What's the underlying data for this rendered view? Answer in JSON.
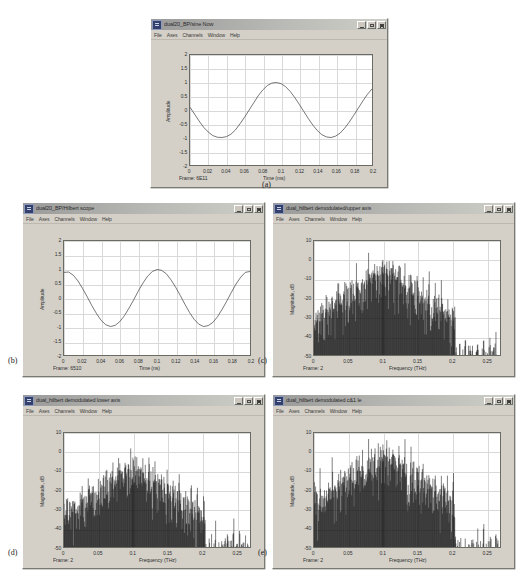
{
  "figure": {
    "background": "#ffffff",
    "captions": [
      {
        "id": "a",
        "label": "(a)"
      },
      {
        "id": "b",
        "label": "(b)"
      },
      {
        "id": "c",
        "label": "(c)"
      },
      {
        "id": "d",
        "label": "(d)"
      },
      {
        "id": "e",
        "label": "(e)"
      }
    ]
  },
  "common": {
    "menu": [
      "File",
      "Axes",
      "Channels",
      "Window",
      "Help"
    ],
    "window_buttons": [
      "minimize",
      "maximize",
      "close"
    ],
    "title_icon": "scope-icon"
  },
  "panels": {
    "a": {
      "title": "dual20_BP/sine Now",
      "frame_status": "Frame: 6E11",
      "chart_data": {
        "type": "line",
        "title": "dual20_BP/sine Now",
        "xlabel": "Time (ms)",
        "ylabel": "Amplitude",
        "xlim": [
          0,
          0.2
        ],
        "ylim": [
          -2,
          2
        ],
        "xticks": [
          "0",
          "0.02",
          "0.04",
          "0.06",
          "0.08",
          "0.1",
          "0.12",
          "0.14",
          "0.16",
          "0.18",
          "0.2"
        ],
        "yticks": [
          "2",
          "1.5",
          "1",
          "0.5",
          "0",
          "-0.5",
          "-1",
          "-1.5",
          "-2"
        ],
        "grid": true,
        "legend": "none",
        "series": [
          {
            "name": "sine",
            "description": "sinusoid, amplitude 1, period 0.12 ms, starting near 0 and descending",
            "x": [
              0,
              0.005,
              0.01,
              0.015,
              0.02,
              0.025,
              0.03,
              0.035,
              0.04,
              0.045,
              0.05,
              0.055,
              0.06,
              0.065,
              0.07,
              0.075,
              0.08,
              0.085,
              0.09,
              0.095,
              0.1,
              0.105,
              0.11,
              0.115,
              0.12,
              0.125,
              0.13,
              0.135,
              0.14,
              0.145,
              0.15,
              0.155,
              0.16,
              0.165,
              0.17,
              0.175,
              0.18,
              0.185,
              0.19,
              0.195,
              0.2
            ],
            "y": [
              0.1,
              -0.15,
              -0.4,
              -0.63,
              -0.8,
              -0.93,
              -0.99,
              -1.0,
              -0.97,
              -0.88,
              -0.72,
              -0.5,
              -0.26,
              0.0,
              0.26,
              0.52,
              0.73,
              0.89,
              0.98,
              1.0,
              0.96,
              0.85,
              0.68,
              0.46,
              0.21,
              -0.05,
              -0.31,
              -0.55,
              -0.75,
              -0.9,
              -0.98,
              -1.0,
              -0.95,
              -0.84,
              -0.66,
              -0.44,
              -0.19,
              0.07,
              0.33,
              0.57,
              0.77
            ]
          }
        ]
      }
    },
    "b": {
      "title": "dual20_BP/Hilbert scope",
      "frame_status": "Frame: 6510",
      "chart_data": {
        "type": "line",
        "title": "dual20_BP/Hilbert scope",
        "xlabel": "Time (ns)",
        "ylabel": "Amplitude",
        "xlim": [
          0,
          0.2
        ],
        "ylim": [
          -2,
          2
        ],
        "xticks": [
          "0",
          "0.02",
          "0.04",
          "0.06",
          "0.08",
          "0.1",
          "0.12",
          "0.14",
          "0.16",
          "0.18",
          "0.2"
        ],
        "yticks": [
          "2",
          "1.5",
          "1",
          "0.5",
          "0",
          "-0.5",
          "-1",
          "-1.5",
          "-2"
        ],
        "grid": true,
        "legend": "none",
        "series": [
          {
            "name": "hilbert",
            "description": "cosine-like wave, amplitude 1, period 0.12 ns, starting at about +0.9",
            "x": [
              0,
              0.005,
              0.01,
              0.015,
              0.02,
              0.025,
              0.03,
              0.035,
              0.04,
              0.045,
              0.05,
              0.055,
              0.06,
              0.065,
              0.07,
              0.075,
              0.08,
              0.085,
              0.09,
              0.095,
              0.1,
              0.105,
              0.11,
              0.115,
              0.12,
              0.125,
              0.13,
              0.135,
              0.14,
              0.145,
              0.15,
              0.155,
              0.16,
              0.165,
              0.17,
              0.175,
              0.18,
              0.185,
              0.19,
              0.195,
              0.2
            ],
            "y": [
              0.9,
              0.91,
              0.8,
              0.6,
              0.33,
              0.04,
              -0.27,
              -0.55,
              -0.79,
              -0.94,
              -1.0,
              -0.96,
              -0.83,
              -0.62,
              -0.35,
              -0.06,
              0.25,
              0.53,
              0.77,
              0.93,
              1.0,
              0.97,
              0.85,
              0.64,
              0.38,
              0.09,
              -0.22,
              -0.51,
              -0.75,
              -0.92,
              -1.0,
              -0.97,
              -0.86,
              -0.66,
              -0.4,
              -0.11,
              0.2,
              0.49,
              0.73,
              0.9,
              0.93
            ]
          }
        ]
      }
    },
    "c": {
      "title": "dual_hilbert demodulated/upper axis",
      "frame_status": "Frame: 2",
      "chart_data": {
        "type": "line",
        "title": "dual_hilbert demodulated/upper axis",
        "xlabel": "Frequency (THz)",
        "ylabel": "Magnitude, dB",
        "xlim": [
          0,
          0.27
        ],
        "ylim": [
          -50,
          10
        ],
        "xticks": [
          "0",
          "0.05",
          "0.1",
          "0.15",
          "0.2",
          "0.25"
        ],
        "yticks": [
          "10",
          "0",
          "-10",
          "-20",
          "-30",
          "-40",
          "-50"
        ],
        "grid": true,
        "legend": "none",
        "peak_frequency": 0.1,
        "peak_magnitude": 0,
        "noise_floor": -50,
        "description": "dense line spectrum with main lobe peaking near 0 dB at 0.1 THz, dropping to about -50 dB noise floor, sidelobe comb across 0 to 0.2 THz"
      }
    },
    "d": {
      "title": "dual_hilbert demodulated lower axis",
      "frame_status": "Frame: 2",
      "chart_data": {
        "type": "line",
        "title": "dual_hilbert demodulated lower axis",
        "xlabel": "Frequency (THz)",
        "ylabel": "Magnitude, dB",
        "xlim": [
          0,
          0.27
        ],
        "ylim": [
          -50,
          10
        ],
        "xticks": [
          "0",
          "0.05",
          "0.1",
          "0.15",
          "0.2",
          "0.25"
        ],
        "yticks": [
          "10",
          "0",
          "-10",
          "-20",
          "-30",
          "-40",
          "-50"
        ],
        "grid": true,
        "legend": "none",
        "peak_frequency": 0.1,
        "peak_magnitude": -3,
        "noise_floor": -50,
        "description": "dense line spectrum, main peak near -3 dB at 0.1 THz, strong sidebands and comb of discrete lines down to -50 dB"
      }
    },
    "e": {
      "title": "dual_hilbert demodulated c&1 le",
      "frame_status": "Frame: 2",
      "chart_data": {
        "type": "line",
        "title": "dual_hilbert demodulated c&1 le",
        "xlabel": "Frequency (THz)",
        "ylabel": "Magnitude, dB",
        "xlim": [
          0,
          0.27
        ],
        "ylim": [
          -50,
          10
        ],
        "xticks": [
          "0",
          "0.05",
          "0.1",
          "0.15",
          "0.2",
          "0.25"
        ],
        "yticks": [
          "10",
          "0",
          "-10",
          "-20",
          "-30",
          "-40",
          "-50"
        ],
        "grid": true,
        "legend": "none",
        "peak_frequency": 0.1,
        "peak_magnitude": 4,
        "noise_floor": -50,
        "description": "dense line spectrum, main peak about +4 dB at 0.1 THz, broad noisy skirt from 0 to 0.17 THz"
      }
    }
  }
}
